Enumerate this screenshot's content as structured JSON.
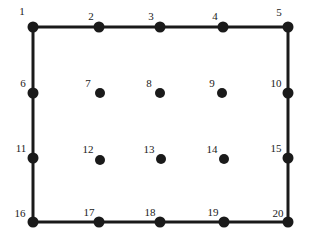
{
  "figure": {
    "type": "node-diagram",
    "title": "",
    "width": 309,
    "height": 241,
    "background_color": "#ffffff",
    "ink_color": "#1a1a1a",
    "edge_width": 3,
    "boundary_node_radius": 5.5,
    "interior_node_radius": 5,
    "label_font_size": 11
  },
  "nodes": [
    {
      "id": "1",
      "label": "1",
      "x": 33,
      "y": 27,
      "kind": "boundary",
      "corner": true,
      "label_x": 22,
      "label_y": 11
    },
    {
      "id": "2",
      "label": "2",
      "x": 99,
      "y": 27,
      "kind": "boundary",
      "corner": false,
      "label_x": 91,
      "label_y": 16
    },
    {
      "id": "3",
      "label": "3",
      "x": 160,
      "y": 27,
      "kind": "boundary",
      "corner": false,
      "label_x": 151,
      "label_y": 16
    },
    {
      "id": "4",
      "label": "4",
      "x": 223,
      "y": 27,
      "kind": "boundary",
      "corner": false,
      "label_x": 215,
      "label_y": 16
    },
    {
      "id": "5",
      "label": "5",
      "x": 288,
      "y": 27,
      "kind": "boundary",
      "corner": true,
      "label_x": 279,
      "label_y": 12
    },
    {
      "id": "6",
      "label": "6",
      "x": 33,
      "y": 93,
      "kind": "boundary",
      "corner": false,
      "label_x": 23,
      "label_y": 83
    },
    {
      "id": "7",
      "label": "7",
      "x": 100,
      "y": 93,
      "kind": "interior",
      "corner": false,
      "label_x": 88,
      "label_y": 83
    },
    {
      "id": "8",
      "label": "8",
      "x": 160,
      "y": 93,
      "kind": "interior",
      "corner": false,
      "label_x": 149,
      "label_y": 83
    },
    {
      "id": "9",
      "label": "9",
      "x": 222,
      "y": 93,
      "kind": "interior",
      "corner": false,
      "label_x": 212,
      "label_y": 83
    },
    {
      "id": "10",
      "label": "10",
      "x": 288,
      "y": 93,
      "kind": "boundary",
      "corner": false,
      "label_x": 276,
      "label_y": 83
    },
    {
      "id": "11",
      "label": "11",
      "x": 33,
      "y": 158,
      "kind": "boundary",
      "corner": false,
      "label_x": 21,
      "label_y": 148
    },
    {
      "id": "12",
      "label": "12",
      "x": 100,
      "y": 160,
      "kind": "interior",
      "corner": false,
      "label_x": 88,
      "label_y": 149
    },
    {
      "id": "13",
      "label": "13",
      "x": 161,
      "y": 159,
      "kind": "interior",
      "corner": false,
      "label_x": 149,
      "label_y": 149
    },
    {
      "id": "14",
      "label": "14",
      "x": 224,
      "y": 159,
      "kind": "interior",
      "corner": false,
      "label_x": 212,
      "label_y": 149
    },
    {
      "id": "15",
      "label": "15",
      "x": 288,
      "y": 158,
      "kind": "boundary",
      "corner": false,
      "label_x": 276,
      "label_y": 148
    },
    {
      "id": "16",
      "label": "16",
      "x": 33,
      "y": 222,
      "kind": "boundary",
      "corner": true,
      "label_x": 20,
      "label_y": 213
    },
    {
      "id": "17",
      "label": "17",
      "x": 99,
      "y": 222,
      "kind": "boundary",
      "corner": false,
      "label_x": 89,
      "label_y": 212
    },
    {
      "id": "18",
      "label": "18",
      "x": 160,
      "y": 222,
      "kind": "boundary",
      "corner": false,
      "label_x": 150,
      "label_y": 212
    },
    {
      "id": "19",
      "label": "19",
      "x": 224,
      "y": 222,
      "kind": "boundary",
      "corner": false,
      "label_x": 213,
      "label_y": 212
    },
    {
      "id": "20",
      "label": "20",
      "x": 288,
      "y": 222,
      "kind": "boundary",
      "corner": true,
      "label_x": 278,
      "label_y": 213
    }
  ],
  "edges": [
    {
      "from": "1",
      "to": "2"
    },
    {
      "from": "2",
      "to": "3"
    },
    {
      "from": "3",
      "to": "4"
    },
    {
      "from": "4",
      "to": "5"
    },
    {
      "from": "1",
      "to": "6"
    },
    {
      "from": "6",
      "to": "11"
    },
    {
      "from": "11",
      "to": "16"
    },
    {
      "from": "5",
      "to": "10"
    },
    {
      "from": "10",
      "to": "15"
    },
    {
      "from": "15",
      "to": "20"
    },
    {
      "from": "16",
      "to": "17"
    },
    {
      "from": "17",
      "to": "18"
    },
    {
      "from": "18",
      "to": "19"
    },
    {
      "from": "19",
      "to": "20"
    }
  ]
}
